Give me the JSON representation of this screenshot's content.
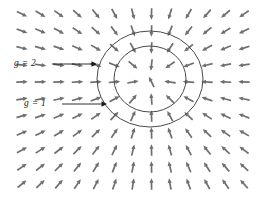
{
  "figure": {
    "name": "radial-vector-field-with-level-curves",
    "background": "#ffffff",
    "width": 266,
    "height": 201
  },
  "style": {
    "arrow_color": "#6e6e73",
    "circle_color": "#4a4a4a",
    "leader_color": "#1a1a1a",
    "label_color": "#1a1a1a"
  },
  "labels": [
    {
      "id": "g2",
      "text": "g = 2",
      "x": 14,
      "y": 58,
      "leader_from": [
        52,
        64
      ],
      "leader_to": [
        97,
        64
      ],
      "target": "outer-circle"
    },
    {
      "id": "g1",
      "text": "g = 1",
      "x": 24,
      "y": 98,
      "leader_from": [
        62,
        104
      ],
      "leader_to": [
        107,
        104
      ],
      "target": "inner-circle"
    }
  ],
  "chart_data": {
    "type": "quiver",
    "title": "",
    "xlabel": "",
    "ylabel": "",
    "field": "inward radial gradient field",
    "center": [
      150,
      79
    ],
    "grid": {
      "cols": 13,
      "rows": 11,
      "x_start": 22,
      "y_start": 14,
      "dx": 18.5,
      "dy": 17.0
    },
    "arrow": {
      "length": 11.5,
      "head_length": 4.6,
      "head_width": 4.2,
      "shaft_width": 1.7,
      "direction": "points toward center"
    },
    "level_curves": [
      {
        "label": "g = 2",
        "cx": 150,
        "cy": 79,
        "rx": 53,
        "ry": 48
      },
      {
        "label": "g = 1",
        "cx": 150,
        "cy": 79,
        "rx": 36,
        "ry": 33
      }
    ]
  }
}
